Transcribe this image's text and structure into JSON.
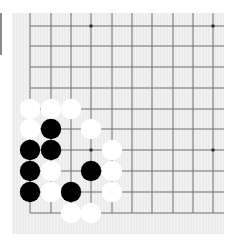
{
  "board": {
    "description": "Go board corner (lower-left), partial view",
    "colors": {
      "background": "#ececec",
      "line": "#6e6e6e",
      "black_stone": "#000000",
      "white_stone": "#ffffff",
      "star": "#333333"
    },
    "grid": {
      "x_lines": [
        30,
        51,
        71,
        91,
        112,
        132,
        152,
        173,
        193,
        213
      ],
      "y_lines": [
        26,
        46,
        67,
        88,
        109,
        129,
        150,
        171,
        192,
        213
      ],
      "left_edge_x": 30,
      "bottom_edge_y": 213
    },
    "star_points": [
      {
        "col": 3,
        "row": 0
      },
      {
        "col": 9,
        "row": 0
      },
      {
        "col": 3,
        "row": 6
      },
      {
        "col": 9,
        "row": 6
      }
    ],
    "stones": [
      {
        "color": "white",
        "col": 0,
        "row": 4
      },
      {
        "color": "white",
        "col": 1,
        "row": 4
      },
      {
        "color": "white",
        "col": 2,
        "row": 4
      },
      {
        "color": "white",
        "col": 0,
        "row": 5
      },
      {
        "color": "black",
        "col": 1,
        "row": 5
      },
      {
        "color": "white",
        "col": 3,
        "row": 5
      },
      {
        "color": "black",
        "col": 0,
        "row": 6
      },
      {
        "color": "black",
        "col": 1,
        "row": 6
      },
      {
        "color": "white",
        "col": 4,
        "row": 6
      },
      {
        "color": "black",
        "col": 0,
        "row": 7
      },
      {
        "color": "white",
        "col": 1,
        "row": 7
      },
      {
        "color": "black",
        "col": 3,
        "row": 7
      },
      {
        "color": "white",
        "col": 4,
        "row": 7
      },
      {
        "color": "black",
        "col": 0,
        "row": 8
      },
      {
        "color": "white",
        "col": 1,
        "row": 8
      },
      {
        "color": "black",
        "col": 2,
        "row": 8
      },
      {
        "color": "white",
        "col": 4,
        "row": 8
      },
      {
        "color": "white",
        "col": 2,
        "row": 9
      },
      {
        "color": "white",
        "col": 3,
        "row": 9
      }
    ]
  }
}
